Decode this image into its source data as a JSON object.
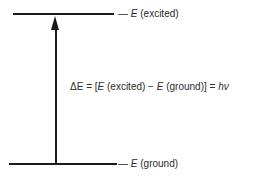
{
  "diagram": {
    "type": "energy-level-diagram",
    "levels": [
      {
        "id": "excited",
        "symbol": "E",
        "label": "(excited)"
      },
      {
        "id": "ground",
        "symbol": "E",
        "label": "(ground)"
      }
    ],
    "transition": {
      "direction": "up",
      "from": "ground",
      "to": "excited"
    },
    "equation": {
      "lhs": "ΔE",
      "eq1": " = [",
      "e1": "E",
      "t1": " (excited) − ",
      "e2": "E",
      "t2": " (ground)] = ",
      "hv": "hν"
    }
  }
}
